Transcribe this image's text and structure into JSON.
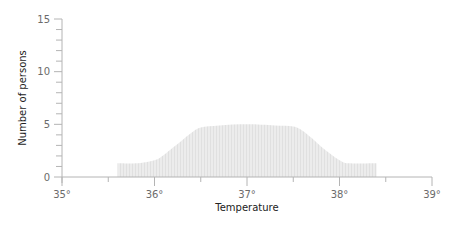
{
  "chart_data": {
    "type": "area",
    "title": "",
    "xlabel": "Temperature",
    "ylabel": "Number of persons",
    "xlim": [
      35,
      39
    ],
    "ylim": [
      0,
      15
    ],
    "x_ticks": [
      35,
      36,
      37,
      38,
      39
    ],
    "x_tick_labels": [
      "35°",
      "36°",
      "37°",
      "38°",
      "39°"
    ],
    "x_minor_ticks": [
      35.5,
      36.5,
      37.5,
      38.5
    ],
    "y_ticks": [
      0,
      5,
      10,
      15
    ],
    "y_tick_labels": [
      "0",
      "5",
      "10",
      "15"
    ],
    "y_minor_step": 1,
    "grid": false,
    "legend": null,
    "fill_color": "#e6e6e6",
    "axis_color": "#b4b4b4",
    "series": [
      {
        "name": "Number of persons",
        "x": [
          35.6,
          35.8,
          36.0,
          36.1,
          36.2,
          36.3,
          36.4,
          36.5,
          36.7,
          37.0,
          37.3,
          37.5,
          37.6,
          37.7,
          37.8,
          37.9,
          38.0,
          38.1,
          38.4
        ],
        "values": [
          1.3,
          1.3,
          1.6,
          2.1,
          2.8,
          3.5,
          4.2,
          4.7,
          4.9,
          5.0,
          4.9,
          4.8,
          4.4,
          3.7,
          2.9,
          2.2,
          1.6,
          1.3,
          1.3
        ]
      }
    ]
  }
}
